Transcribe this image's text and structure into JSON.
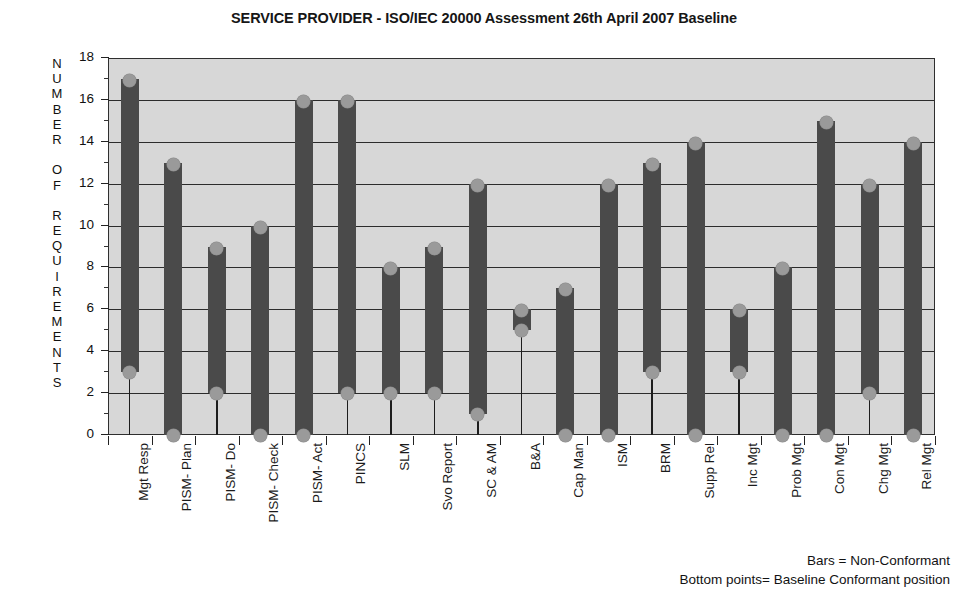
{
  "chart_data": {
    "type": "bar",
    "title": "SERVICE PROVIDER - ISO/IEC 20000 Assessment 26th April 2007 Baseline",
    "xlabel": "",
    "ylabel": "NUMBER OF REQUIREMENTS",
    "ylim": [
      0,
      18
    ],
    "ytick_step": 2,
    "yticks": [
      0,
      2,
      4,
      6,
      8,
      10,
      12,
      14,
      16,
      18
    ],
    "grid": true,
    "legend_position": "bottom-right",
    "categories": [
      "Mgt Resp",
      "PISM- Plan",
      "PISM- Do",
      "PISM- Check",
      "PISM- Act",
      "PINCS",
      "SLM",
      "Svo Report",
      "SC & AM",
      "B&A",
      "Cap Man",
      "ISM",
      "BRM",
      "Supp Rel",
      "Inc Mgt",
      "Prob Mgt",
      "Con Mgt",
      "Chg Mgt",
      "Rel Mgt"
    ],
    "series": [
      {
        "name": "Non-Conformant (bar top)",
        "values": [
          17,
          13,
          9,
          10,
          16,
          16,
          8,
          9,
          12,
          6,
          7,
          12,
          13,
          14,
          6,
          8,
          15,
          12,
          14
        ]
      },
      {
        "name": "Baseline Conformant position (bottom point)",
        "values": [
          3,
          0,
          2,
          0,
          0,
          2,
          2,
          2,
          1,
          5,
          0,
          0,
          3,
          0,
          3,
          0,
          0,
          2,
          0
        ]
      }
    ],
    "annotations": [
      "Bars = Non-Conformant",
      "Bottom points= Baseline Conformant position"
    ],
    "colors": {
      "bar_fill": "#4a4a4a",
      "marker_fill": "#9a9a9a",
      "plot_background": "#d7d7d7",
      "axis": "#2b2b2b",
      "text": "#121212"
    }
  },
  "legend": {
    "line1": "Bars = Non-Conformant",
    "line2": "Bottom points= Baseline Conformant position"
  },
  "yaxis": {
    "title": "NUMBER OF REQUIREMENTS",
    "title_letters": [
      "N",
      "U",
      "M",
      "B",
      "E",
      "R",
      "",
      "O",
      "F",
      "",
      "R",
      "E",
      "Q",
      "U",
      "I",
      "R",
      "E",
      "M",
      "E",
      "N",
      "T",
      "S"
    ]
  }
}
